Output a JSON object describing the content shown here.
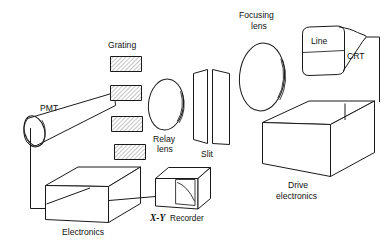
{
  "figure": {
    "kind": "optical-system-schematic",
    "background_color": "#ffffff",
    "line_color": "#1a1a1a",
    "width": 390,
    "height": 244
  },
  "labels": {
    "grating": "Grating",
    "pmt": "PMT",
    "relay_lens_line1": "Relay",
    "relay_lens_line2": "lens",
    "slit": "Slit",
    "focusing_lens_line1": "Focusing",
    "focusing_lens_line2": "lens",
    "line": "Line",
    "crt": "CRT",
    "drive_line1": "Drive",
    "drive_line2": "electronics",
    "electronics": "Electronics",
    "recorder_prefix": "X-Y",
    "recorder_suffix": "Recorder"
  },
  "components": [
    {
      "id": "pmt",
      "name": "PMT",
      "shape": "cylinder"
    },
    {
      "id": "grating",
      "name": "Grating",
      "shape": "hatched-plates",
      "count": 4
    },
    {
      "id": "relay-lens",
      "name": "Relay lens",
      "shape": "lens-ellipse"
    },
    {
      "id": "slit",
      "name": "Slit",
      "shape": "twin-plates"
    },
    {
      "id": "focusing-lens",
      "name": "Focusing lens",
      "shape": "lens-ellipse"
    },
    {
      "id": "crt",
      "name": "CRT",
      "shape": "crt-tube"
    },
    {
      "id": "drive-electronics",
      "name": "Drive electronics",
      "shape": "box"
    },
    {
      "id": "electronics",
      "name": "Electronics",
      "shape": "box"
    },
    {
      "id": "xy-recorder",
      "name": "X-Y Recorder",
      "shape": "box-with-trace"
    }
  ],
  "connections": [
    {
      "from": "pmt",
      "to": "electronics"
    },
    {
      "from": "electronics",
      "to": "xy-recorder"
    },
    {
      "from": "crt",
      "to": "drive-electronics"
    }
  ]
}
